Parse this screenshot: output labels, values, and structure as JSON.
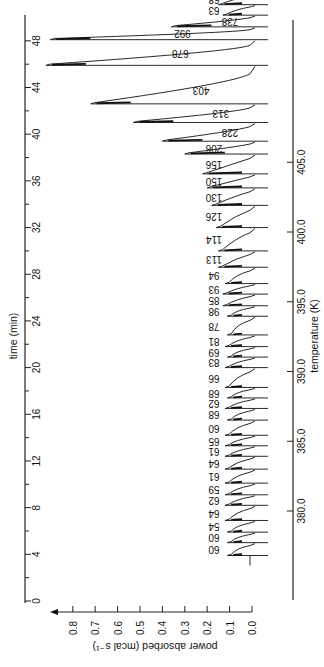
{
  "chart_data": {
    "type": "line",
    "title": "",
    "orientation": "rotated-90",
    "time_axis": {
      "label": "time (min)",
      "range": [
        0,
        49
      ],
      "ticks": [
        0,
        4,
        8,
        12,
        16,
        20,
        24,
        28,
        32,
        36,
        40,
        44,
        48
      ],
      "tick_labels": [
        "0",
        "4",
        "8",
        "12",
        "16",
        "20",
        "24",
        "28",
        "32",
        "36",
        "40",
        "44",
        "48"
      ]
    },
    "power_axis": {
      "label": "power absorbed (mcal s⁻¹)",
      "range": [
        0.0,
        0.85
      ],
      "ticks": [
        0.0,
        0.1,
        0.2,
        0.3,
        0.4,
        0.5,
        0.6,
        0.7,
        0.8
      ],
      "tick_labels": [
        "0.0",
        "0.1",
        "0.2",
        "0.3",
        "0.4",
        "0.5",
        "0.6",
        "0.7",
        "0.8"
      ]
    },
    "temperature_axis": {
      "label": "temperature (K)",
      "ticks": [
        380.0,
        385.0,
        390.0,
        395.0,
        400.0,
        405.0
      ],
      "tick_labels": [
        "380.0",
        "385.0",
        "390.0",
        "395.0",
        "400.0",
        "405.0"
      ]
    },
    "peaks": [
      {
        "time": 3.9,
        "height": 0.11,
        "label": "60"
      },
      {
        "time": 5.0,
        "height": 0.11,
        "label": "60"
      },
      {
        "time": 5.9,
        "height": 0.11,
        "label": "54"
      },
      {
        "time": 6.9,
        "height": 0.12,
        "label": "64"
      },
      {
        "time": 8.2,
        "height": 0.12,
        "label": "62"
      },
      {
        "time": 9.1,
        "height": 0.12,
        "label": "59"
      },
      {
        "time": 10.1,
        "height": 0.12,
        "label": "61"
      },
      {
        "time": 11.3,
        "height": 0.12,
        "label": "64"
      },
      {
        "time": 12.4,
        "height": 0.12,
        "label": "61"
      },
      {
        "time": 13.3,
        "height": 0.12,
        "label": "65"
      },
      {
        "time": 14.2,
        "height": 0.12,
        "label": "60"
      },
      {
        "time": 15.5,
        "height": 0.11,
        "label": "68"
      },
      {
        "time": 16.5,
        "height": 0.12,
        "label": "62"
      },
      {
        "time": 17.4,
        "height": 0.11,
        "label": "68"
      },
      {
        "time": 18.3,
        "height": 0.12,
        "label": "66"
      },
      {
        "time": 20.0,
        "height": 0.12,
        "label": "83"
      },
      {
        "time": 20.9,
        "height": 0.11,
        "label": "69"
      },
      {
        "time": 21.8,
        "height": 0.12,
        "label": "81"
      },
      {
        "time": 22.8,
        "height": 0.11,
        "label": "78"
      },
      {
        "time": 24.4,
        "height": 0.11,
        "label": "98"
      },
      {
        "time": 25.3,
        "height": 0.13,
        "label": "85"
      },
      {
        "time": 26.3,
        "height": 0.13,
        "label": "93"
      },
      {
        "time": 27.2,
        "height": 0.12,
        "label": "94"
      },
      {
        "time": 28.6,
        "height": 0.15,
        "label": "113"
      },
      {
        "time": 30.0,
        "height": 0.15,
        "label": "114"
      },
      {
        "time": 32.0,
        "height": 0.16,
        "label": "126"
      },
      {
        "time": 33.9,
        "height": 0.18,
        "label": "130"
      },
      {
        "time": 35.4,
        "height": 0.2,
        "label": "150"
      },
      {
        "time": 36.6,
        "height": 0.22,
        "label": "156"
      },
      {
        "time": 38.3,
        "height": 0.3,
        "label": "206"
      },
      {
        "time": 39.4,
        "height": 0.4,
        "label": "228"
      },
      {
        "time": 41.0,
        "height": 0.53,
        "label": "313"
      },
      {
        "time": 42.6,
        "height": 0.72,
        "label": "403"
      },
      {
        "time": 45.9,
        "height": 0.92,
        "label": "678"
      },
      {
        "time": 48.1,
        "height": 0.9,
        "label": "992"
      },
      {
        "time": 49.2,
        "height": 0.36,
        "label": "738"
      },
      {
        "time": 50.2,
        "height": 0.13,
        "label": "63"
      },
      {
        "time": 51.1,
        "height": 0.15,
        "label": "68"
      },
      {
        "time": 52.1,
        "height": 0.1,
        "label": "64"
      }
    ]
  }
}
